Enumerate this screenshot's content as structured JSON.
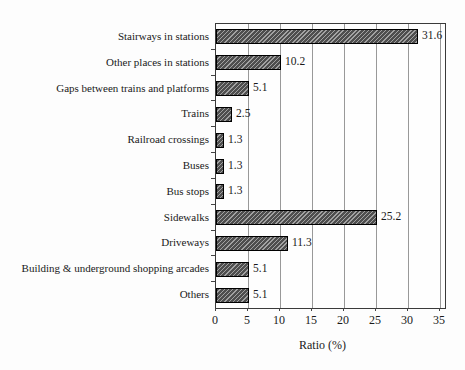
{
  "chart_data": {
    "type": "bar",
    "orientation": "horizontal",
    "title": "",
    "xlabel": "Ratio (%)",
    "ylabel": "",
    "xlim": [
      0,
      35
    ],
    "x_ticks": [
      0,
      5,
      10,
      15,
      20,
      25,
      30,
      35
    ],
    "grid": true,
    "legend": false,
    "bar_style": "diagonal-hatch",
    "categories": [
      "Stairways in stations",
      "Other places in stations",
      "Gaps between trains and platforms",
      "Trains",
      "Railroad crossings",
      "Buses",
      "Bus stops",
      "Sidewalks",
      "Driveways",
      "Building & underground shopping arcades",
      "Others"
    ],
    "values": [
      31.6,
      10.2,
      5.1,
      2.5,
      1.3,
      1.3,
      1.3,
      25.2,
      11.3,
      5.1,
      5.1
    ],
    "value_labels": [
      "31.6",
      "10.2",
      "5.1",
      "2.5",
      "1.3",
      "1.3",
      "1.3",
      "25.2",
      "11.3",
      "5.1",
      "5.1"
    ]
  },
  "colors": {
    "bar_fill": "#555555",
    "bar_hatch_light": "#a2a2a2",
    "bar_border": "#000000",
    "gridline": "#999999",
    "plot_border": "#3a3a3a",
    "text": "#1a1a1a",
    "background": "#fdfdfd"
  }
}
